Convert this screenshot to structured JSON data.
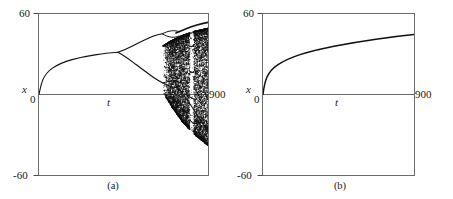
{
  "figure": {
    "background": "#ffffff",
    "ink": "#1a1a1a",
    "axis_color": "#555555",
    "panels": [
      {
        "id": "a",
        "caption": "(a)",
        "ylabel": "x",
        "xlabel": "t",
        "ytop_label": "60",
        "ybottom_label": "-60",
        "yzero_label": "0",
        "xend_label": "900"
      },
      {
        "id": "b",
        "caption": "(b)",
        "ylabel": "x",
        "xlabel": "t",
        "ytop_label": "60",
        "ybottom_label": "-60",
        "yzero_label": "0",
        "xend_label": "900"
      }
    ]
  },
  "chart_data": [
    {
      "type": "scatter",
      "title": "(a)",
      "xlabel": "t",
      "ylabel": "x",
      "xlim": [
        0,
        900
      ],
      "ylim": [
        -60,
        60
      ],
      "xticks": [
        0,
        900
      ],
      "xticklabels": [
        "0",
        "900"
      ],
      "yticks": [
        -60,
        0,
        60
      ],
      "yticklabels": [
        "-60",
        "0",
        "60"
      ],
      "grid": false,
      "legend": null,
      "description": "Period-doubling route to chaos: single branch grows from origin, splits at t~420 into two branches, splits again near t~620, then a broadening chaotic band fills from t~660 to t=900 with a narrow periodic window near t~810.",
      "features": {
        "branch_origin": {
          "t": 0,
          "x": 0
        },
        "first_bifurcation": {
          "t": 420,
          "x": 20
        },
        "second_bifurcation_upper": {
          "t": 618,
          "x": 32
        },
        "second_bifurcation_lower": {
          "t": 620,
          "x": 5
        },
        "chaos_onset": {
          "t": 660
        },
        "periodic_window": {
          "t_start": 800,
          "t_end": 822
        },
        "band_top_at_end": {
          "t": 900,
          "x": 49
        },
        "band_bottom_at_end": {
          "t": 900,
          "x": -38
        }
      },
      "primary_branch": {
        "t": [
          0,
          20,
          45,
          80,
          120,
          170,
          220,
          280,
          340,
          420
        ],
        "x": [
          0,
          6.5,
          9.8,
          12.4,
          14.4,
          16.2,
          17.5,
          18.8,
          19.7,
          20.4
        ]
      },
      "upper_branch": {
        "t": [
          420,
          450,
          490,
          530,
          570,
          618
        ],
        "x": [
          20.4,
          24.5,
          27.6,
          29.6,
          31.1,
          32.2
        ]
      },
      "lower_branch": {
        "t": [
          420,
          450,
          490,
          530,
          570,
          620
        ],
        "x": [
          20.4,
          16.0,
          12.4,
          9.6,
          7.2,
          5.0
        ]
      },
      "upper_envelope": {
        "t": [
          660,
          700,
          760,
          820,
          900
        ],
        "x": [
          36.0,
          39.5,
          43.5,
          46.5,
          49.0
        ]
      },
      "lower_envelope": {
        "t": [
          660,
          700,
          760,
          820,
          900
        ],
        "x": [
          1.0,
          -8.0,
          -20.0,
          -29.0,
          -38.0
        ]
      }
    },
    {
      "type": "line",
      "title": "(b)",
      "xlabel": "t",
      "ylabel": "x",
      "xlim": [
        0,
        900
      ],
      "ylim": [
        -60,
        60
      ],
      "xticks": [
        0,
        900
      ],
      "xticklabels": [
        "0",
        "900"
      ],
      "yticks": [
        -60,
        0,
        60
      ],
      "yticklabels": [
        "-60",
        "0",
        "60"
      ],
      "grid": false,
      "legend": null,
      "description": "Single smooth monotonically increasing curve rising steeply from the origin then flattening, ending near x = 28 at t = 900. No bifurcation, no chaos.",
      "series": [
        {
          "name": "x(t)",
          "t": [
            0,
            10,
            25,
            45,
            70,
            110,
            160,
            220,
            300,
            400,
            500,
            620,
            750,
            900
          ],
          "x": [
            0,
            6.0,
            9.2,
            11.8,
            13.8,
            16.2,
            18.4,
            20.4,
            22.4,
            24.2,
            25.5,
            26.8,
            27.8,
            28.6
          ]
        }
      ]
    }
  ]
}
